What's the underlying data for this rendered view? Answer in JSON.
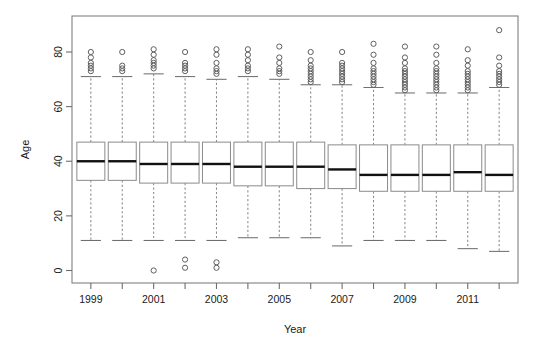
{
  "chart_data": {
    "type": "box",
    "title": "",
    "xlabel": "Year",
    "ylabel": "Age",
    "xlim": [
      1998.4,
      2012.6
    ],
    "ylim": [
      -3,
      92
    ],
    "grid": false,
    "legend": null,
    "x_tick_labels": [
      "1999",
      "2001",
      "2003",
      "2005",
      "2007",
      "2009",
      "2011"
    ],
    "x_tick_values": [
      1999,
      2001,
      2003,
      2005,
      2007,
      2009,
      2011
    ],
    "x_minor_tick_values": [
      2000,
      2002,
      2004,
      2006,
      2008,
      2010,
      2012
    ],
    "y_tick_labels": [
      "0",
      "20",
      "40",
      "60",
      "80"
    ],
    "y_tick_values": [
      0,
      20,
      40,
      60,
      80
    ],
    "categories": [
      1999,
      2000,
      2001,
      2002,
      2003,
      2004,
      2005,
      2006,
      2007,
      2008,
      2009,
      2010,
      2011,
      2012
    ],
    "boxes": [
      {
        "year": 1999,
        "whisker_low": 11,
        "q1": 33,
        "median": 40,
        "q3": 47,
        "whisker_high": 71,
        "outliers_high": [
          73,
          74,
          75,
          76,
          78,
          80
        ],
        "outliers_low": []
      },
      {
        "year": 2000,
        "whisker_low": 11,
        "q1": 33,
        "median": 40,
        "q3": 47,
        "whisker_high": 71,
        "outliers_high": [
          73,
          74,
          75,
          80
        ],
        "outliers_low": []
      },
      {
        "year": 2001,
        "whisker_low": 11,
        "q1": 32,
        "median": 39,
        "q3": 47,
        "whisker_high": 72,
        "outliers_high": [
          74,
          75,
          76,
          77,
          79,
          81
        ],
        "outliers_low": [
          0
        ]
      },
      {
        "year": 2002,
        "whisker_low": 11,
        "q1": 32,
        "median": 39,
        "q3": 47,
        "whisker_high": 71,
        "outliers_high": [
          73,
          74,
          75,
          76,
          80
        ],
        "outliers_low": [
          1,
          4
        ]
      },
      {
        "year": 2003,
        "whisker_low": 11,
        "q1": 32,
        "median": 39,
        "q3": 47,
        "whisker_high": 70,
        "outliers_high": [
          72,
          73,
          74,
          76,
          79,
          81
        ],
        "outliers_low": [
          1,
          3
        ]
      },
      {
        "year": 2004,
        "whisker_low": 12,
        "q1": 31,
        "median": 38,
        "q3": 47,
        "whisker_high": 71,
        "outliers_high": [
          73,
          74,
          75,
          77,
          79,
          81
        ],
        "outliers_low": []
      },
      {
        "year": 2005,
        "whisker_low": 12,
        "q1": 31,
        "median": 38,
        "q3": 47,
        "whisker_high": 70,
        "outliers_high": [
          72,
          73,
          74,
          76,
          78,
          82
        ],
        "outliers_low": []
      },
      {
        "year": 2006,
        "whisker_low": 12,
        "q1": 30,
        "median": 38,
        "q3": 47,
        "whisker_high": 68,
        "outliers_high": [
          69,
          70,
          71,
          72,
          73,
          74,
          75,
          77,
          80
        ],
        "outliers_low": []
      },
      {
        "year": 2007,
        "whisker_low": 9,
        "q1": 30,
        "median": 37,
        "q3": 46,
        "whisker_high": 68,
        "outliers_high": [
          69,
          70,
          71,
          72,
          73,
          74,
          75,
          76,
          80
        ],
        "outliers_low": []
      },
      {
        "year": 2008,
        "whisker_low": 11,
        "q1": 29,
        "median": 35,
        "q3": 46,
        "whisker_high": 67,
        "outliers_high": [
          68,
          69,
          70,
          71,
          72,
          73,
          74,
          76,
          79,
          83
        ],
        "outliers_low": []
      },
      {
        "year": 2009,
        "whisker_low": 11,
        "q1": 29,
        "median": 35,
        "q3": 46,
        "whisker_high": 65,
        "outliers_high": [
          66,
          67,
          68,
          69,
          70,
          71,
          72,
          73,
          74,
          76,
          78,
          82
        ],
        "outliers_low": []
      },
      {
        "year": 2010,
        "whisker_low": 11,
        "q1": 29,
        "median": 35,
        "q3": 46,
        "whisker_high": 65,
        "outliers_high": [
          66,
          67,
          68,
          69,
          70,
          71,
          72,
          73,
          74,
          76,
          79,
          82
        ],
        "outliers_low": []
      },
      {
        "year": 2011,
        "whisker_low": 8,
        "q1": 29,
        "median": 36,
        "q3": 46,
        "whisker_high": 65,
        "outliers_high": [
          66,
          67,
          68,
          69,
          70,
          71,
          72,
          73,
          75,
          77,
          81
        ],
        "outliers_low": []
      },
      {
        "year": 2012,
        "whisker_low": 7,
        "q1": 29,
        "median": 35,
        "q3": 46,
        "whisker_high": 67,
        "outliers_high": [
          68,
          69,
          70,
          71,
          72,
          73,
          75,
          78,
          88
        ],
        "outliers_low": []
      }
    ]
  },
  "plot": {
    "frame": {
      "left": 72,
      "right": 518,
      "top": 16,
      "bottom": 283
    },
    "y_axis_pixels": {
      "value_0": 270.5,
      "value_80": 52.0
    },
    "box_half_width_px": 14
  }
}
